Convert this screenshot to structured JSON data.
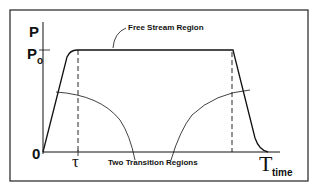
{
  "diagram": {
    "y_axis_label": "P",
    "y_level_label_main": "P",
    "y_level_label_sub": "o",
    "origin_label": "0",
    "tau_label": "τ",
    "end_time_label": "T",
    "x_axis_label": "time",
    "annotations": {
      "free_stream": "Free Stream Region",
      "transitions": "Two Transition Regions"
    },
    "colors": {
      "line": "#111111",
      "background": "#ffffff"
    }
  }
}
